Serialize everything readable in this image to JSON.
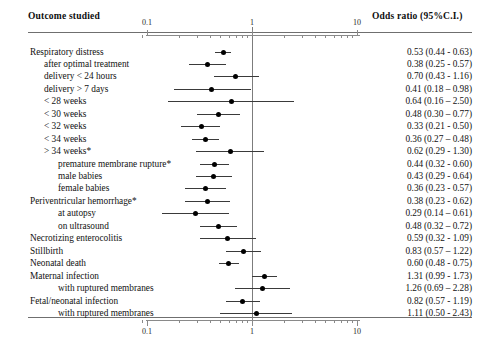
{
  "header": {
    "outcome_label": "Outcome studied",
    "or_label": "Odds ratio (95%C.I.)"
  },
  "axis": {
    "scale": "log",
    "tick_labels": [
      "0.1",
      "1",
      "10"
    ],
    "tick_values": [
      0.1,
      1,
      10
    ],
    "null_line": 1,
    "x_min": 0.08,
    "x_max": 12
  },
  "chart_data": {
    "type": "forest",
    "title": "",
    "xlabel": "Odds ratio (95%C.I.)",
    "ylabel": "Outcome studied",
    "xscale": "log",
    "xlim": [
      0.08,
      12
    ],
    "xticks": [
      0.1,
      1,
      10
    ],
    "xticklabels": [
      "0.1",
      "1",
      "10"
    ],
    "reference_line": 1,
    "grid": false,
    "legend": "none",
    "columns": [
      "Outcome studied",
      "Odds ratio (95%C.I.)"
    ],
    "rows": [
      {
        "label": "Respiratory distress",
        "indent": 0,
        "or": 0.53,
        "lo": 0.44,
        "hi": 0.63,
        "text": "0.53 (0.44 - 0.63)"
      },
      {
        "label": "after optimal treatment",
        "indent": 1,
        "or": 0.38,
        "lo": 0.25,
        "hi": 0.57,
        "text": "0.38 (0.25 - 0.57)"
      },
      {
        "label": "delivery < 24 hours",
        "indent": 1,
        "or": 0.7,
        "lo": 0.43,
        "hi": 1.16,
        "text": "0.70 (0.43 - 1.16)"
      },
      {
        "label": "delivery > 7 days",
        "indent": 1,
        "or": 0.41,
        "lo": 0.18,
        "hi": 0.98,
        "text": "0.41 (0.18 – 0.98)"
      },
      {
        "label": "< 28 weeks",
        "indent": 1,
        "or": 0.64,
        "lo": 0.16,
        "hi": 2.5,
        "text": "0.64 (0.16 – 2.50)"
      },
      {
        "label": "< 30 weeks",
        "indent": 1,
        "or": 0.48,
        "lo": 0.3,
        "hi": 0.77,
        "text": "0.48 (0.30 – 0.77)"
      },
      {
        "label": "< 32 weeks",
        "indent": 1,
        "or": 0.33,
        "lo": 0.21,
        "hi": 0.5,
        "text": "0.33 (0.21 - 0.50)"
      },
      {
        "label": "< 34 weeks",
        "indent": 1,
        "or": 0.36,
        "lo": 0.27,
        "hi": 0.48,
        "text": "0.36 (0.27 – 0.48)"
      },
      {
        "label": "> 34 weeks*",
        "indent": 1,
        "or": 0.62,
        "lo": 0.29,
        "hi": 1.3,
        "text": "0.62 (0.29 - 1.30)"
      },
      {
        "label": "premature membrane rupture*",
        "indent": 2,
        "or": 0.44,
        "lo": 0.32,
        "hi": 0.6,
        "text": "0.44 (0.32 - 0.60)"
      },
      {
        "label": "male babies",
        "indent": 2,
        "or": 0.43,
        "lo": 0.29,
        "hi": 0.64,
        "text": "0.43 (0.29 - 0.64)"
      },
      {
        "label": "female babies",
        "indent": 2,
        "or": 0.36,
        "lo": 0.23,
        "hi": 0.57,
        "text": "0.36 (0.23 - 0.57)"
      },
      {
        "label": "Periventricular hemorrhage*",
        "indent": 0,
        "or": 0.38,
        "lo": 0.23,
        "hi": 0.62,
        "text": "0.38 (0.23 - 0.62)"
      },
      {
        "label": "at autopsy",
        "indent": 2,
        "or": 0.29,
        "lo": 0.14,
        "hi": 0.61,
        "text": "0.29 (0.14 – 0.61)"
      },
      {
        "label": "on ultrasound",
        "indent": 2,
        "or": 0.48,
        "lo": 0.32,
        "hi": 0.72,
        "text": "0.48 (0.32 – 0.72)"
      },
      {
        "label": "Necrotizing enterocolitis",
        "indent": 0,
        "or": 0.59,
        "lo": 0.32,
        "hi": 1.09,
        "text": "0.59 (0.32 - 1.09)"
      },
      {
        "label": "Stillbirth",
        "indent": 0,
        "or": 0.83,
        "lo": 0.57,
        "hi": 1.22,
        "text": "0.83 (0.57 – 1.22)"
      },
      {
        "label": "Neonatal death",
        "indent": 0,
        "or": 0.6,
        "lo": 0.48,
        "hi": 0.75,
        "text": "0.60 (0.48 - 0.75)"
      },
      {
        "label": "Maternal infection",
        "indent": 0,
        "or": 1.31,
        "lo": 0.99,
        "hi": 1.73,
        "text": "1.31 (0.99 - 1.73)"
      },
      {
        "label": "with ruptured membranes",
        "indent": 2,
        "or": 1.26,
        "lo": 0.69,
        "hi": 2.28,
        "text": "1.26 (0.69 – 2.28)"
      },
      {
        "label": "Fetal/neonatal infection",
        "indent": 0,
        "or": 0.82,
        "lo": 0.57,
        "hi": 1.19,
        "text": "0.82 (0.57 - 1.19)"
      },
      {
        "label": "with ruptured membranes",
        "indent": 2,
        "or": 1.11,
        "lo": 0.5,
        "hi": 2.43,
        "text": "1.11 (0.50 - 2.43)"
      }
    ]
  },
  "colors": {
    "marker": "#000000",
    "ci_line": "#3a3a3a",
    "axis": "#8a8a8a",
    "rule": "#6f6f6f",
    "reference": "#7c7c7c",
    "text": "#111111"
  }
}
